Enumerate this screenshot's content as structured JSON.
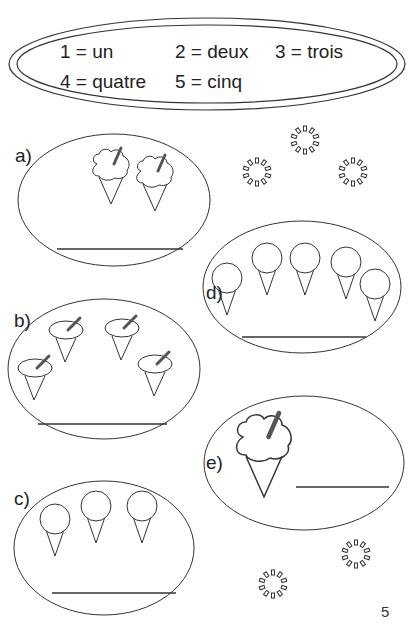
{
  "legend": {
    "items": [
      {
        "number": "1",
        "word": "un",
        "text": "1 = un"
      },
      {
        "number": "2",
        "word": "deux",
        "text": "2 = deux"
      },
      {
        "number": "3",
        "word": "trois",
        "text": "3 = trois"
      },
      {
        "number": "4",
        "word": "quatre",
        "text": "4 = quatre"
      },
      {
        "number": "5",
        "word": "cinq",
        "text": "5 = cinq"
      }
    ]
  },
  "exercises": [
    {
      "label": "a)",
      "icon": "soft-serve-ice-cream-icon",
      "count": 2,
      "answer": ""
    },
    {
      "label": "b)",
      "icon": "soft-serve-ice-cream-icon",
      "count": 4,
      "answer": ""
    },
    {
      "label": "c)",
      "icon": "scoop-ice-cream-cone-icon",
      "count": 3,
      "answer": ""
    },
    {
      "label": "d)",
      "icon": "scoop-ice-cream-cone-icon",
      "count": 5,
      "answer": ""
    },
    {
      "label": "e)",
      "icon": "soft-serve-ice-cream-icon",
      "count": 1,
      "answer": ""
    }
  ],
  "decorations": {
    "icon": "sparkle-ring-icon",
    "count": 5
  },
  "page_number": "5",
  "colors": {
    "ink": "#222222",
    "stroke": "#333333",
    "spoon": "#555555",
    "paper": "#ffffff"
  }
}
